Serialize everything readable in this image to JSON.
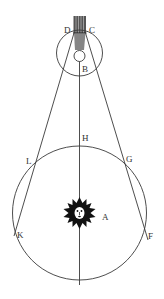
{
  "figure": {
    "type": "geometric astronomical diagram",
    "labels": {
      "D": "D",
      "C": "C",
      "B": "B",
      "H": "H",
      "L": "L",
      "G": "G",
      "A": "A",
      "K": "K",
      "F": "F"
    },
    "center_icon": "sun-face-icon",
    "caption": ""
  },
  "colors": {
    "line": "#3a3a3a",
    "background": "#ffffff",
    "sun": "#111111",
    "label": "#333333"
  }
}
